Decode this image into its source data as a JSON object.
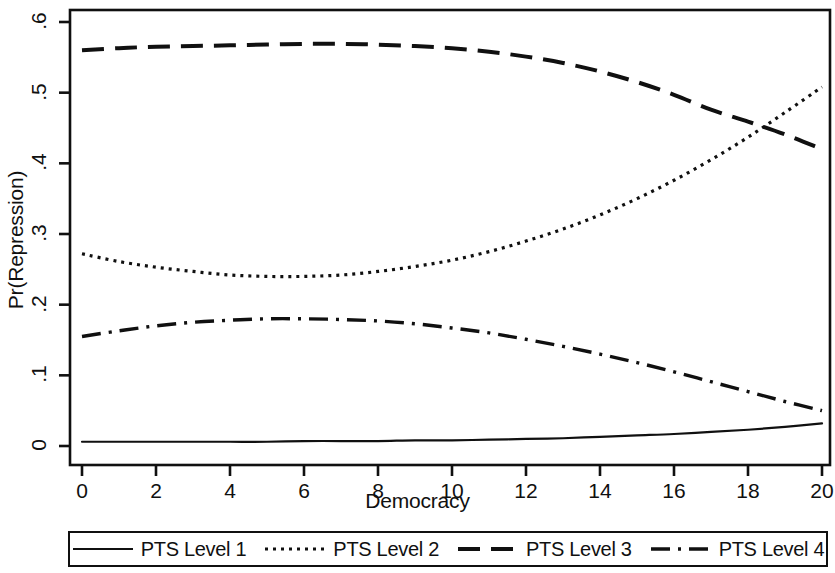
{
  "chart_data": {
    "type": "line",
    "title": "",
    "subtitle": "",
    "xlabel": "Democracy",
    "ylabel": "Pr(Repression)",
    "xlim": [
      0,
      20
    ],
    "ylim": [
      0,
      0.6
    ],
    "xticks": [
      0,
      2,
      4,
      6,
      8,
      10,
      12,
      14,
      16,
      18,
      20
    ],
    "xtick_labels": [
      "0",
      "2",
      "4",
      "6",
      "8",
      "10",
      "12",
      "14",
      "16",
      "18",
      "20"
    ],
    "yticks": [
      0,
      0.1,
      0.2,
      0.3,
      0.4,
      0.5,
      0.6
    ],
    "ytick_labels": [
      "0",
      ".1",
      ".2",
      ".3",
      ".4",
      ".5",
      ".6"
    ],
    "grid": false,
    "legend_position": "bottom",
    "x": [
      0,
      1,
      2,
      3,
      4,
      5,
      6,
      7,
      8,
      9,
      10,
      11,
      12,
      13,
      14,
      15,
      16,
      17,
      18,
      19,
      20
    ],
    "series": [
      {
        "name": "PTS Level 1",
        "style": "solid",
        "color": "#101010",
        "values": [
          0.006,
          0.006,
          0.006,
          0.006,
          0.006,
          0.006,
          0.007,
          0.007,
          0.007,
          0.008,
          0.008,
          0.009,
          0.01,
          0.011,
          0.013,
          0.015,
          0.017,
          0.02,
          0.023,
          0.027,
          0.032
        ]
      },
      {
        "name": "PTS Level 2",
        "style": "dotted",
        "color": "#101010",
        "values": [
          0.272,
          0.261,
          0.253,
          0.247,
          0.242,
          0.24,
          0.24,
          0.242,
          0.247,
          0.254,
          0.263,
          0.275,
          0.29,
          0.307,
          0.327,
          0.35,
          0.376,
          0.405,
          0.437,
          0.472,
          0.508
        ]
      },
      {
        "name": "PTS Level 3",
        "style": "dashed",
        "color": "#101010",
        "values": [
          0.56,
          0.563,
          0.565,
          0.566,
          0.567,
          0.568,
          0.569,
          0.569,
          0.568,
          0.566,
          0.563,
          0.558,
          0.551,
          0.542,
          0.53,
          0.515,
          0.497,
          0.476,
          0.459,
          0.441,
          0.42
        ]
      },
      {
        "name": "PTS Level 4",
        "style": "dashdot",
        "color": "#101010",
        "values": [
          0.155,
          0.163,
          0.17,
          0.175,
          0.178,
          0.18,
          0.18,
          0.179,
          0.177,
          0.173,
          0.167,
          0.16,
          0.151,
          0.141,
          0.13,
          0.118,
          0.105,
          0.091,
          0.077,
          0.063,
          0.05
        ]
      }
    ]
  },
  "legend": {
    "entries": [
      {
        "label": "PTS Level 1",
        "style": "solid"
      },
      {
        "label": "PTS Level 2",
        "style": "dotted"
      },
      {
        "label": "PTS Level 3",
        "style": "dashed"
      },
      {
        "label": "PTS Level 4",
        "style": "dashdot"
      }
    ]
  }
}
